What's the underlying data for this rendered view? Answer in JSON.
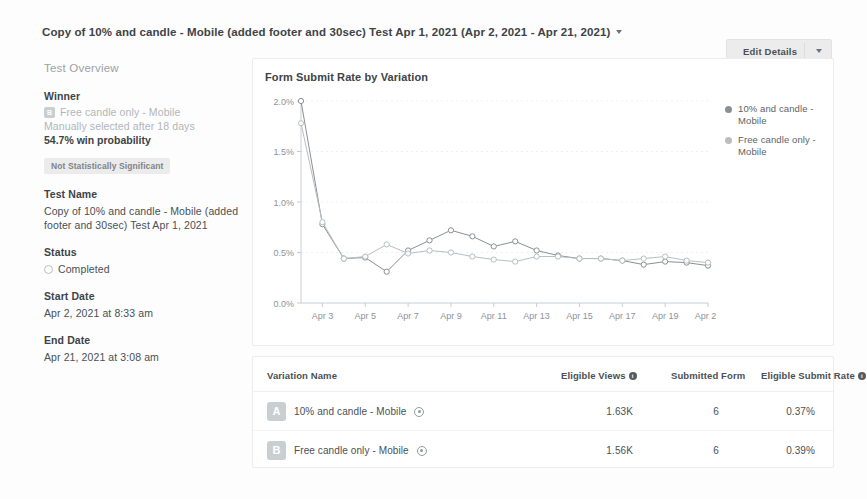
{
  "header": {
    "title": "Copy of 10% and candle - Mobile (added footer and 30sec) Test Apr 1, 2021 (Apr 2, 2021 - Apr 21, 2021)",
    "caret_icon": "chevron-down-icon",
    "edit_button_label": "Edit Details",
    "edit_button_caret_icon": "chevron-down-icon"
  },
  "sidebar": {
    "section_title": "Test Overview",
    "winner": {
      "label": "Winner",
      "badge": "B",
      "name": "Free candle only - Mobile",
      "subtitle": "Manually selected after 18 days",
      "probability": "54.7% win probability",
      "significance_pill": "Not Statistically Significant"
    },
    "test_name": {
      "label": "Test Name",
      "value": "Copy of 10% and candle - Mobile (added footer and 30sec) Test Apr 1, 2021"
    },
    "status": {
      "label": "Status",
      "value": "Completed",
      "icon": "status-circle-icon"
    },
    "start_date": {
      "label": "Start Date",
      "value": "Apr 2, 2021 at 8:33 am"
    },
    "end_date": {
      "label": "End Date",
      "value": "Apr 21, 2021 at 3:08 am"
    }
  },
  "chart_card": {
    "title": "Form Submit Rate by Variation"
  },
  "chart_data": {
    "type": "line",
    "title": "Form Submit Rate by Variation",
    "xlabel": "",
    "ylabel": "",
    "ylim": [
      0,
      2.0
    ],
    "ytick_labels": [
      "0.0%",
      "0.5%",
      "1.0%",
      "1.5%",
      "2.0%"
    ],
    "ytick_values": [
      0.0,
      0.5,
      1.0,
      1.5,
      2.0
    ],
    "x": [
      "Apr 2",
      "Apr 3",
      "Apr 4",
      "Apr 5",
      "Apr 6",
      "Apr 7",
      "Apr 8",
      "Apr 9",
      "Apr 10",
      "Apr 11",
      "Apr 12",
      "Apr 13",
      "Apr 14",
      "Apr 15",
      "Apr 16",
      "Apr 17",
      "Apr 18",
      "Apr 19",
      "Apr 20",
      "Apr 21"
    ],
    "xtick_labels": [
      "Apr 3",
      "Apr 5",
      "Apr 7",
      "Apr 9",
      "Apr 11",
      "Apr 13",
      "Apr 15",
      "Apr 17",
      "Apr 19",
      "Apr 21"
    ],
    "grid": true,
    "legend_position": "right",
    "series": [
      {
        "name": "10% and candle - Mobile",
        "color": "#8a8f93",
        "values": [
          2.0,
          0.78,
          0.44,
          0.45,
          0.31,
          0.52,
          0.62,
          0.72,
          0.66,
          0.56,
          0.61,
          0.52,
          0.47,
          0.44,
          0.44,
          0.42,
          0.38,
          0.41,
          0.4,
          0.37
        ]
      },
      {
        "name": "Free candle only - Mobile",
        "color": "#b9bec2",
        "values": [
          1.78,
          0.8,
          0.44,
          0.46,
          0.58,
          0.49,
          0.52,
          0.5,
          0.46,
          0.43,
          0.41,
          0.46,
          0.46,
          0.44,
          0.44,
          0.42,
          0.44,
          0.46,
          0.42,
          0.4
        ]
      }
    ]
  },
  "table": {
    "headers": {
      "variation_name": "Variation Name",
      "eligible_views": "Eligible Views",
      "submitted_form": "Submitted Form",
      "eligible_submit_rate": "Eligible Submit Rate"
    },
    "rows": [
      {
        "badge": "A",
        "name": "10% and candle - Mobile",
        "eligible_views": "1.63K",
        "submitted_form": "6",
        "eligible_submit_rate": "0.37%"
      },
      {
        "badge": "B",
        "name": "Free candle only - Mobile",
        "eligible_views": "1.56K",
        "submitted_form": "6",
        "eligible_submit_rate": "0.39%"
      }
    ]
  }
}
